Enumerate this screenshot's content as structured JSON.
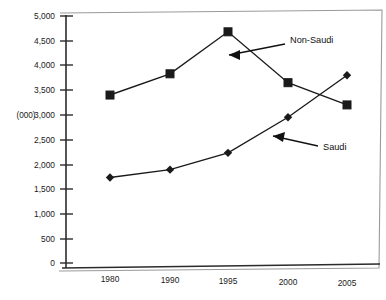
{
  "chart_data": {
    "type": "line",
    "title": "",
    "subtitle": "",
    "xlabel": "",
    "ylabel": "(000)",
    "categories": [
      "1980",
      "1990",
      "1995",
      "2000",
      "2005"
    ],
    "x_tick_labels": [
      "1980",
      "1990",
      "1995",
      "2000",
      "2005"
    ],
    "y_tick_labels": [
      "0",
      "500",
      "1,000",
      "1,500",
      "2,000",
      "2,500",
      "3,000",
      "3,500",
      "4,000",
      "4,500",
      "5,000"
    ],
    "y_tick_values": [
      0,
      500,
      1000,
      1500,
      2000,
      2500,
      3000,
      3500,
      4000,
      4500,
      5000
    ],
    "ylim": [
      0,
      5000
    ],
    "grid": false,
    "legend_position": "inline-annotations",
    "series": [
      {
        "name": "Non-Saudi",
        "marker": "square",
        "values": [
          3400,
          3830,
          4680,
          3650,
          3200
        ]
      },
      {
        "name": "Saudi",
        "marker": "diamond",
        "values": [
          1730,
          1890,
          2230,
          2950,
          3800
        ]
      }
    ],
    "annotations": [
      {
        "text": "Non-Saudi",
        "target_series": "Non-Saudi",
        "arrow": "left"
      },
      {
        "text": "Saudi",
        "target_series": "Saudi",
        "arrow": "left"
      }
    ],
    "colors": {
      "line": "#1a1a1a",
      "marker": "#1a1a1a",
      "axis": "#2b2b2b",
      "frame": "#8a8a8a",
      "background": "#ffffff"
    }
  }
}
